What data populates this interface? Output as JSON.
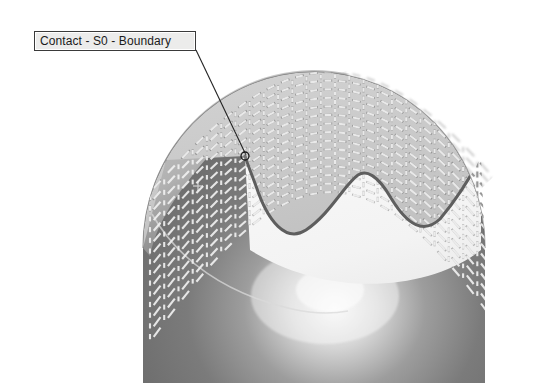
{
  "viewport": {
    "width": 539,
    "height": 383,
    "background": "#ffffff"
  },
  "annotation": {
    "label": "Contact - S0 - Boundary",
    "label_box": {
      "x": 34,
      "y": 31,
      "width": 162,
      "height": 20,
      "fill": "#ececeb",
      "border": "#3a3a3a"
    },
    "leader_line": {
      "from_x": 196,
      "from_y": 50,
      "to_x": 246,
      "to_y": 155,
      "color": "#232323",
      "width": 1
    },
    "anchor_marker": {
      "x": 245,
      "y": 156,
      "radius": 4,
      "shape": "circle-outline",
      "color": "#1a1a1a"
    }
  },
  "scene": {
    "title_hidden": true,
    "solid": {
      "name": "dome-solid",
      "shape": "ellipsoid-dome",
      "center_x": 314,
      "center_y": 248,
      "radius_x": 171,
      "radius_y": 176,
      "top_y": 72,
      "fill_dark": "#6f6f6f",
      "fill_mid": "#8d8d8d",
      "fill_light": "#c9c9c9",
      "highlight": "#f2f2f2",
      "outline": "#5d5d5d"
    },
    "mesh_surface": {
      "name": "contact-mesh",
      "style": "dashed-quad-grid",
      "cell_size": 8,
      "color_above_boundary": "#9c9c9c",
      "color_below_boundary": "#fbfbfb",
      "color_overhang": "#c4c4c4",
      "rows": 14,
      "cols": 26
    },
    "boundary_curve": {
      "name": "contact-boundary-curve",
      "color": "#5e5e5e",
      "width": 3,
      "points": [
        [
          245,
          156
        ],
        [
          258,
          182
        ],
        [
          272,
          208
        ],
        [
          288,
          227
        ],
        [
          306,
          230
        ],
        [
          324,
          214
        ],
        [
          341,
          189
        ],
        [
          358,
          175
        ],
        [
          374,
          180
        ],
        [
          391,
          198
        ],
        [
          407,
          217
        ],
        [
          423,
          226
        ],
        [
          440,
          219
        ],
        [
          456,
          200
        ],
        [
          470,
          178
        ],
        [
          481,
          157
        ]
      ]
    },
    "latitude_line": {
      "name": "silhouette-latitude-line",
      "color": "#d8d8d8",
      "points": [
        [
          152,
          216
        ],
        [
          200,
          266
        ],
        [
          262,
          300
        ],
        [
          330,
          312
        ]
      ]
    }
  }
}
